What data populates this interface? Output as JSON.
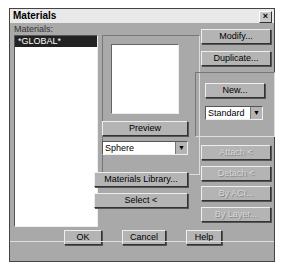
{
  "window": {
    "title": "Materials",
    "close_label": "×"
  },
  "materials_list": {
    "label": "Materials:",
    "items": [
      "*GLOBAL*"
    ],
    "selected": "*GLOBAL*"
  },
  "preview": {
    "button_label": "Preview",
    "shape_select": "Sphere"
  },
  "buttons": {
    "modify": "Modify...",
    "duplicate": "Duplicate...",
    "new": "New...",
    "materials_library": "Materials Library...",
    "select": "Select <",
    "attach": "Attach <",
    "detach": "Detach <",
    "by_aci": "By ACI...",
    "by_layer": "By Layer...",
    "ok": "OK",
    "cancel": "Cancel",
    "help": "Help"
  },
  "type_select": {
    "value": "Standard"
  }
}
